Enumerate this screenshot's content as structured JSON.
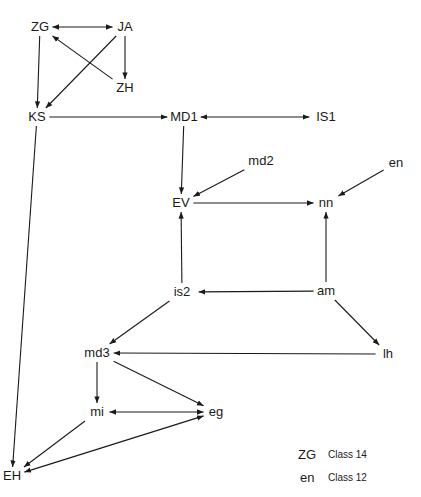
{
  "nodes": {
    "ZG": {
      "label": "ZG",
      "x": 40,
      "y": 27
    },
    "JA": {
      "label": "JA",
      "x": 125,
      "y": 27
    },
    "ZH": {
      "label": "ZH",
      "x": 125,
      "y": 88
    },
    "KS": {
      "label": "KS",
      "x": 37,
      "y": 117
    },
    "MD1": {
      "label": "MD1",
      "x": 184,
      "y": 117
    },
    "IS1": {
      "label": "IS1",
      "x": 326,
      "y": 117
    },
    "md2": {
      "label": "md2",
      "x": 261,
      "y": 161
    },
    "en": {
      "label": "en",
      "x": 396,
      "y": 163
    },
    "EV": {
      "label": "EV",
      "x": 181,
      "y": 203
    },
    "nn": {
      "label": "nn",
      "x": 326,
      "y": 203
    },
    "is2": {
      "label": "is2",
      "x": 182,
      "y": 292
    },
    "am": {
      "label": "am",
      "x": 326,
      "y": 291
    },
    "md3": {
      "label": "md3",
      "x": 97,
      "y": 353
    },
    "lh": {
      "label": "lh",
      "x": 388,
      "y": 354
    },
    "mi": {
      "label": "mi",
      "x": 97,
      "y": 412
    },
    "eg": {
      "label": "eg",
      "x": 216,
      "y": 412
    },
    "EH": {
      "label": "EH",
      "x": 12,
      "y": 476
    }
  },
  "edges": [
    {
      "from": "ZG",
      "to": "JA",
      "bidirectional": true
    },
    {
      "from": "ZG",
      "to": "KS",
      "bidirectional": false
    },
    {
      "from": "JA",
      "to": "ZH",
      "bidirectional": false
    },
    {
      "from": "JA",
      "to": "KS",
      "bidirectional": false
    },
    {
      "from": "ZH",
      "to": "ZG",
      "bidirectional": false
    },
    {
      "from": "KS",
      "to": "MD1",
      "bidirectional": false
    },
    {
      "from": "KS",
      "to": "EH",
      "bidirectional": false
    },
    {
      "from": "MD1",
      "to": "IS1",
      "bidirectional": true
    },
    {
      "from": "MD1",
      "to": "EV",
      "bidirectional": false
    },
    {
      "from": "md2",
      "to": "EV",
      "bidirectional": false
    },
    {
      "from": "en",
      "to": "nn",
      "bidirectional": false
    },
    {
      "from": "EV",
      "to": "nn",
      "bidirectional": false
    },
    {
      "from": "is2",
      "to": "EV",
      "bidirectional": false
    },
    {
      "from": "am",
      "to": "nn",
      "bidirectional": false
    },
    {
      "from": "am",
      "to": "is2",
      "bidirectional": false
    },
    {
      "from": "am",
      "to": "lh",
      "bidirectional": false
    },
    {
      "from": "is2",
      "to": "md3",
      "bidirectional": false
    },
    {
      "from": "lh",
      "to": "md3",
      "bidirectional": false
    },
    {
      "from": "md3",
      "to": "mi",
      "bidirectional": false
    },
    {
      "from": "md3",
      "to": "eg",
      "bidirectional": false
    },
    {
      "from": "mi",
      "to": "eg",
      "bidirectional": true
    },
    {
      "from": "mi",
      "to": "EH",
      "bidirectional": false
    },
    {
      "from": "eg",
      "to": "EH",
      "bidirectional": true
    }
  ],
  "legend": [
    {
      "key": "ZG",
      "text": "Class 14"
    },
    {
      "key": "en",
      "text": "Class 12"
    }
  ]
}
